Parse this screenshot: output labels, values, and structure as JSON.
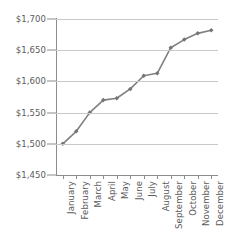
{
  "chart_data": {
    "type": "line",
    "title": "",
    "subtitle": "",
    "xlabel": "",
    "ylabel": "",
    "categories": [
      "January",
      "February",
      "March",
      "April",
      "May",
      "June",
      "July",
      "August",
      "September",
      "October",
      "November",
      "December"
    ],
    "values": [
      1500,
      1520,
      1550,
      1570,
      1573,
      1588,
      1609,
      1613,
      1654,
      1667,
      1677,
      1682
    ],
    "series": [
      {
        "name": "",
        "values": [
          1500,
          1520,
          1550,
          1570,
          1573,
          1588,
          1609,
          1613,
          1654,
          1667,
          1677,
          1682
        ]
      }
    ],
    "ylim": [
      1450,
      1700
    ],
    "ytick_values": [
      1450,
      1500,
      1550,
      1600,
      1650,
      1700
    ],
    "ytick_labels": [
      "$1,450",
      "$1,500",
      "$1,550",
      "$1,600",
      "$1,650",
      "$1,700"
    ],
    "grid": true,
    "grid_axis": "y",
    "legend": false,
    "legend_position": "none",
    "marker": "diamond",
    "annotations": []
  },
  "style": {
    "line_color": "#808080",
    "marker_color": "#757575",
    "grid_color": "#c9c9c9",
    "axis_color": "#8c8c8c",
    "text_color": "#5a5a5a",
    "background": "#ffffff"
  }
}
